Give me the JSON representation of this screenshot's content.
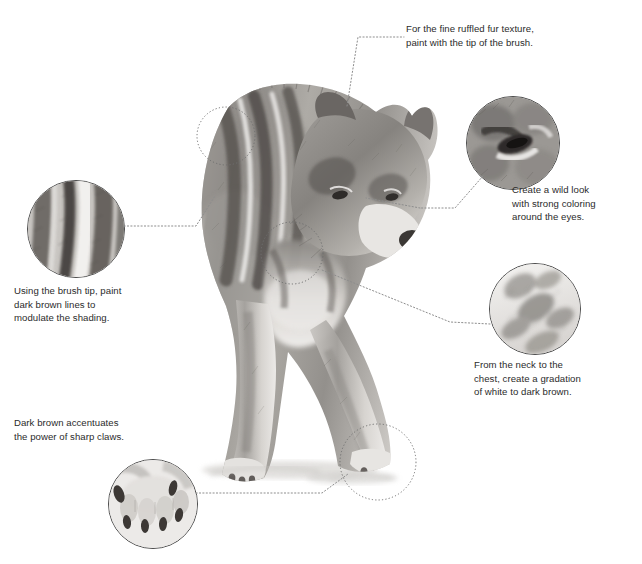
{
  "page": {
    "background_color": "#ffffff",
    "text_color": "#2b2b2b",
    "line_color": "#8d8d8d",
    "ring_color": "#6f6f6f"
  },
  "subject": {
    "name": "wolf-illustration",
    "description": "Grayscale painted illustration of a wolf walking forward with head lowered"
  },
  "annotations": [
    {
      "id": "fur-texture",
      "text": "For the fine ruffled fur texture,\npaint with the tip of the brush.",
      "align": "left"
    },
    {
      "id": "eyes",
      "text": "Create a wild look\nwith strong coloring\naround the eyes.",
      "align": "left"
    },
    {
      "id": "shading",
      "text": "Using the brush tip, paint\ndark brown lines to\nmodulate the shading.",
      "align": "left"
    },
    {
      "id": "neck-gradation",
      "text": "From the neck to the\nchest, create a gradation\nof white to dark brown.",
      "align": "left"
    },
    {
      "id": "claws",
      "text": "Dark brown accentuates\nthe power of sharp claws.",
      "align": "left"
    }
  ],
  "insets": [
    {
      "id": "inset-eye",
      "label": "eye-detail-inset",
      "cx": 512,
      "cy": 142,
      "r": 46
    },
    {
      "id": "inset-back",
      "label": "back-stripes-inset",
      "cx": 75,
      "cy": 228,
      "r": 48
    },
    {
      "id": "inset-neck",
      "label": "neck-gradation-inset",
      "cx": 534,
      "cy": 308,
      "r": 45
    },
    {
      "id": "inset-paw",
      "label": "paw-claws-inset",
      "cx": 152,
      "cy": 503,
      "r": 44
    }
  ],
  "target_rings": [
    {
      "id": "ring-back",
      "cx": 226,
      "cy": 136,
      "r": 29
    },
    {
      "id": "ring-neck",
      "cx": 292,
      "cy": 253,
      "r": 31
    },
    {
      "id": "ring-paw",
      "cx": 378,
      "cy": 462,
      "r": 38
    }
  ]
}
